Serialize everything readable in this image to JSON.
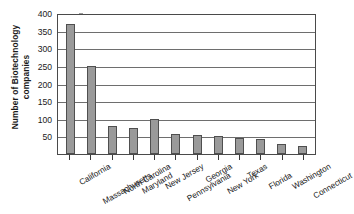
{
  "chart_data": {
    "type": "bar",
    "title": "",
    "xlabel": "",
    "ylabel": "Number of Biotechnology companies",
    "ylabel_line1": "Number of Biotechnology",
    "ylabel_line2": "companies",
    "ylim": [
      0,
      400
    ],
    "ytick_labels": [
      "400",
      "350",
      "300",
      "250",
      "200",
      "150",
      "100",
      "50"
    ],
    "ytick_values": [
      400,
      350,
      300,
      250,
      200,
      150,
      100,
      50
    ],
    "grid": "horizontal",
    "legend": "none",
    "bar_color": "#9a9a9a",
    "bar_edge_color": "#4f4f4f",
    "axis_color": "#4a4a4a",
    "gridline_color": "#6e6e6e",
    "categories": [
      "California",
      "Massachusetts",
      "North Carolina",
      "Maryland",
      "New Jersey",
      "Pennsylvania",
      "Georgia",
      "New York",
      "Texas",
      "Florida",
      "Washington",
      "Connecticut"
    ],
    "values": [
      370,
      250,
      80,
      75,
      100,
      58,
      53,
      52,
      45,
      42,
      28,
      22
    ]
  }
}
